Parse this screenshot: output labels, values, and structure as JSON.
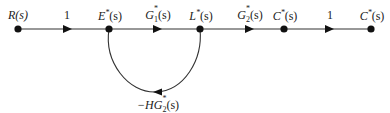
{
  "diagram": {
    "type": "signal-flow-graph",
    "nodes": [
      {
        "id": "R",
        "label": "R(s)",
        "x": 18
      },
      {
        "id": "E",
        "label": "E*(s)",
        "x": 109
      },
      {
        "id": "L",
        "label": "L*(s)",
        "x": 200
      },
      {
        "id": "C1",
        "label": "C*(s)",
        "x": 284
      },
      {
        "id": "C2",
        "label": "C*(s)",
        "x": 371
      }
    ],
    "branches": [
      {
        "from": "R",
        "to": "E",
        "gain": "1"
      },
      {
        "from": "E",
        "to": "L",
        "gain": "G1*(s)"
      },
      {
        "from": "L",
        "to": "C1",
        "gain": "G2*(s)"
      },
      {
        "from": "C1",
        "to": "C2",
        "gain": "1"
      }
    ],
    "feedback": {
      "from": "L",
      "to": "E",
      "gain": "−HG2*(s)"
    },
    "labels": {
      "node_R": "R(s)",
      "node_E_main": "E",
      "node_E_sup": "*",
      "node_E_tail": "(s)",
      "node_L_main": "L",
      "node_L_sup": "*",
      "node_L_tail": "(s)",
      "node_C1_main": "C",
      "node_C1_sup": "*",
      "node_C1_tail": "(s)",
      "node_C2_main": "C",
      "node_C2_sup": "*",
      "node_C2_tail": "(s)",
      "gain_RE": "1",
      "gain_EL_main": "G",
      "gain_EL_sub": "1",
      "gain_EL_sup": "*",
      "gain_EL_tail": "(s)",
      "gain_LC_main": "G",
      "gain_LC_sub": "2",
      "gain_LC_sup": "*",
      "gain_LC_tail": "(s)",
      "gain_CC": "1",
      "feedback_prefix": "−HG",
      "feedback_sub": "2",
      "feedback_sup": "*",
      "feedback_tail": "(s)"
    },
    "colors": {
      "line": "#222222",
      "node": "#111111"
    }
  }
}
